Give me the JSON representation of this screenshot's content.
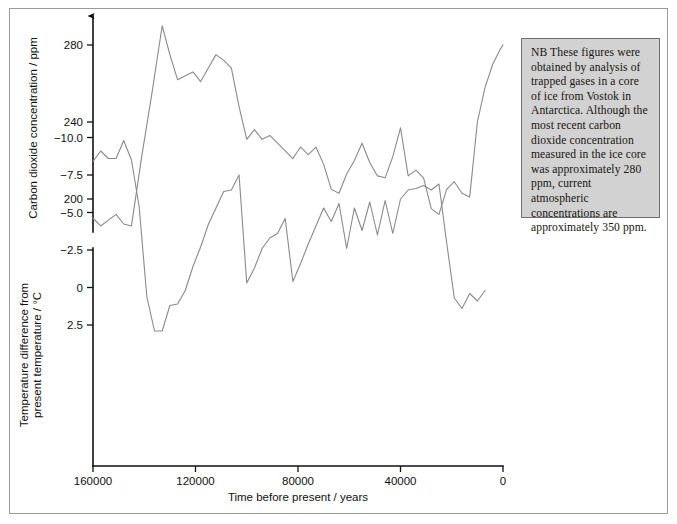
{
  "figure": {
    "note": {
      "name": "explanatory-note",
      "text": "NB These figures were obtained by analysis of trapped gases in a core of ice from Vostok in Antarctica. Although the most recent carbon dioxide concentration measured in the ice core was approximately 280 ppm, current atmospheric concentrations are approximately 350 ppm."
    },
    "frame_color": "#9a9a9a",
    "line_color": "#8a8a8a",
    "note_fill": "#d2d2d2",
    "note_border": "#6e6e6e"
  },
  "chart_data": [
    {
      "type": "line",
      "id": "co2",
      "title": "",
      "xlabel": "Time before present / years",
      "ylabel": "Carbon dioxide concentration / ppm",
      "xlim": [
        160000,
        0
      ],
      "ylim": [
        180,
        295
      ],
      "grid": false,
      "legend": "none",
      "xticks": [
        160000,
        120000,
        80000,
        40000,
        0
      ],
      "xticklabels": [
        "160000",
        "120000",
        "80000",
        "40000",
        "0"
      ],
      "yticks": [
        200,
        240,
        280
      ],
      "yticklabels": [
        "200",
        "240",
        "280"
      ],
      "axis_arrow": true,
      "series": [
        {
          "name": "Carbon dioxide concentration",
          "x": [
            160000,
            157000,
            154000,
            151000,
            148000,
            145000,
            141000,
            137000,
            133000,
            130000,
            127000,
            124000,
            121000,
            118000,
            115000,
            112000,
            109000,
            106000,
            103000,
            100000,
            97000,
            94000,
            91000,
            88000,
            85000,
            82000,
            79000,
            76000,
            73000,
            70000,
            67000,
            64000,
            61000,
            58000,
            55000,
            52000,
            49000,
            46000,
            43000,
            40000,
            37000,
            34000,
            31000,
            28000,
            25000,
            22000,
            19000,
            16000,
            13000,
            10000,
            7000,
            4000,
            1000,
            0
          ],
          "y": [
            190,
            186,
            189,
            192,
            187,
            186,
            222,
            255,
            290,
            275,
            262,
            264,
            266,
            261,
            268,
            275,
            272,
            268,
            248,
            231,
            236,
            231,
            233,
            229,
            225,
            221,
            227,
            223,
            227,
            218,
            205,
            203,
            213,
            220,
            229,
            219,
            212,
            211,
            222,
            237,
            212,
            215,
            211,
            195,
            192,
            205,
            209,
            203,
            201,
            240,
            258,
            270,
            278,
            280
          ]
        }
      ]
    },
    {
      "type": "line",
      "id": "temperature",
      "title": "",
      "xlabel": "Time before present / years",
      "ylabel": "Temperature difference from present temperature / °C",
      "xlim": [
        160000,
        0
      ],
      "ylim": [
        -11.0,
        3.6
      ],
      "grid": false,
      "legend": "none",
      "xticks": [
        160000,
        120000,
        80000,
        40000,
        0
      ],
      "xticklabels": [
        "160000",
        "120000",
        "80000",
        "40000",
        "0"
      ],
      "yticks": [
        2.5,
        0,
        -2.5,
        -5.0,
        -7.5,
        -10.0
      ],
      "yticklabels": [
        "2.5",
        "0",
        "−2.5",
        "−5.0",
        "−7.5",
        "−10.0"
      ],
      "axis_arrow": false,
      "series": [
        {
          "name": "Temperature difference from present temperature",
          "x": [
            160000,
            157000,
            154000,
            151000,
            148000,
            145000,
            142000,
            139000,
            136000,
            133000,
            130000,
            127000,
            124000,
            121000,
            118000,
            115000,
            112000,
            109000,
            106000,
            103000,
            100000,
            97000,
            94000,
            91000,
            88000,
            85000,
            82000,
            79000,
            76000,
            73000,
            70000,
            67000,
            64000,
            61000,
            58000,
            55000,
            52000,
            49000,
            46000,
            43000,
            40000,
            37000,
            34000,
            31000,
            28000,
            25000,
            22000,
            19000,
            16000,
            13000,
            10000,
            7000,
            4000,
            2000,
            0
          ],
          "y": [
            -8.4,
            -9.1,
            -8.6,
            -8.6,
            -9.8,
            -8.5,
            -5.4,
            0.6,
            2.9,
            2.9,
            1.2,
            1.1,
            0.2,
            -1.4,
            -2.7,
            -4.2,
            -5.3,
            -6.4,
            -6.5,
            -7.5,
            -0.3,
            -1.3,
            -2.6,
            -3.3,
            -3.6,
            -4.6,
            -0.4,
            -1.6,
            -2.9,
            -4.1,
            -5.3,
            -4.4,
            -5.6,
            -2.6,
            -5.3,
            -3.8,
            -5.7,
            -3.5,
            -5.8,
            -3.6,
            -5.9,
            -6.5,
            -6.6,
            -6.8,
            -6.5,
            -6.9,
            -3.0,
            0.7,
            1.4,
            0.4,
            0.9,
            0.2
          ]
        }
      ]
    }
  ]
}
